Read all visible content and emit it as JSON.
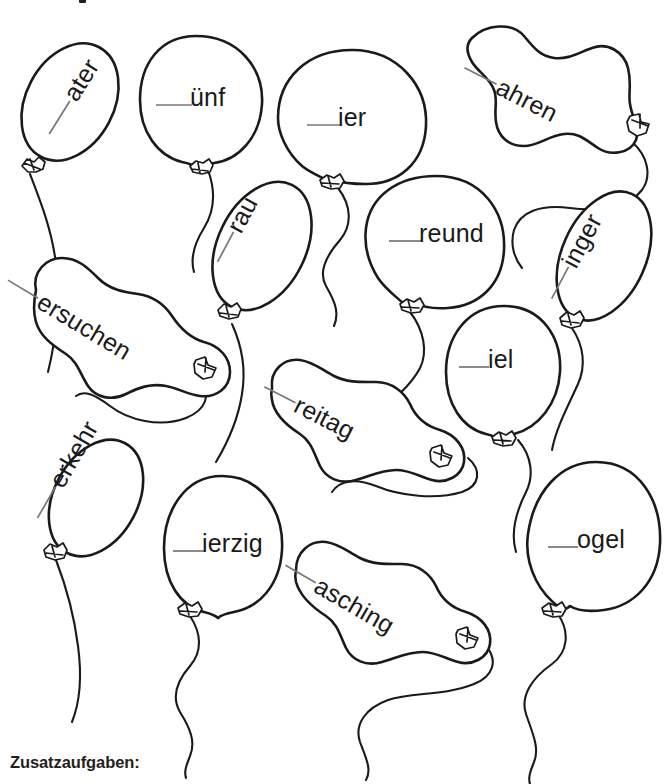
{
  "page": {
    "width": 672,
    "height": 784,
    "background_color": "#ffffff",
    "ink_color": "#1a1a1a",
    "blank_rule_color": "#777777",
    "title_fragment_top": ""
  },
  "worksheet": {
    "type": "fill-in-the-missing-initial-letter",
    "language": "German",
    "balloon_count": 14,
    "blank_marker": "___"
  },
  "balloons": [
    {
      "id": "balloon-ater",
      "word_fragment": "ater",
      "shape": "oval-tilted",
      "rotation_deg": -58,
      "text_x": 74,
      "text_y": 100
    },
    {
      "id": "balloon-uenf",
      "word_fragment": "ünf",
      "shape": "round",
      "rotation_deg": 0,
      "text_x": 173,
      "text_y": 98
    },
    {
      "id": "balloon-ier",
      "word_fragment": "ier",
      "shape": "round",
      "rotation_deg": 0,
      "text_x": 322,
      "text_y": 118
    },
    {
      "id": "balloon-ahren",
      "word_fragment": "ahren",
      "shape": "modelling-long",
      "rotation_deg": 27,
      "text_x": 497,
      "text_y": 90
    },
    {
      "id": "balloon-rau",
      "word_fragment": "rau",
      "shape": "oval-tilted",
      "rotation_deg": -62,
      "text_x": 238,
      "text_y": 232
    },
    {
      "id": "balloon-reund",
      "word_fragment": "reund",
      "shape": "round",
      "rotation_deg": 0,
      "text_x": 391,
      "text_y": 235
    },
    {
      "id": "balloon-inger",
      "word_fragment": "inger",
      "shape": "oval-tilted",
      "rotation_deg": -62,
      "text_x": 573,
      "text_y": 267
    },
    {
      "id": "balloon-ersuchen",
      "word_fragment": "ersuchen",
      "shape": "modelling-long",
      "rotation_deg": 31,
      "text_x": 38,
      "text_y": 304
    },
    {
      "id": "balloon-iel",
      "word_fragment": "iel",
      "shape": "round",
      "rotation_deg": 0,
      "text_x": 467,
      "text_y": 360
    },
    {
      "id": "balloon-reitag",
      "word_fragment": "reitag",
      "shape": "modelling-long",
      "rotation_deg": 27,
      "text_x": 295,
      "text_y": 408
    },
    {
      "id": "balloon-erkehr",
      "word_fragment": "erkehr",
      "shape": "oval-tilted",
      "rotation_deg": -60,
      "text_x": 60,
      "text_y": 487
    },
    {
      "id": "balloon-ierzig",
      "word_fragment": "ierzig",
      "shape": "round",
      "rotation_deg": 0,
      "text_x": 174,
      "text_y": 544
    },
    {
      "id": "balloon-asching",
      "word_fragment": "asching",
      "shape": "modelling-long",
      "rotation_deg": 30,
      "text_x": 315,
      "text_y": 588
    },
    {
      "id": "balloon-ogel",
      "word_fragment": "ogel",
      "shape": "round",
      "rotation_deg": 0,
      "text_x": 548,
      "text_y": 542
    }
  ],
  "footer": {
    "heading": "Zusatzaufgaben:",
    "sub_line": ""
  }
}
